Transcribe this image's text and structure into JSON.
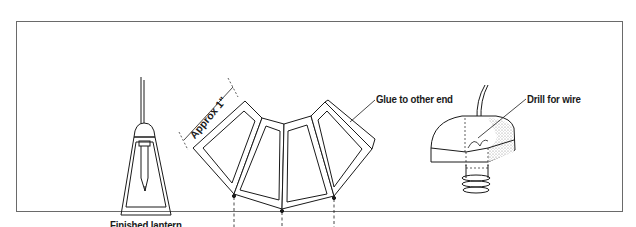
{
  "diagram": {
    "labels": {
      "finished_lantern": "Finished lantern",
      "approx": "Approx 1\"",
      "glue": "Glue to other end",
      "bend": "Bend",
      "drill": "Drill for wire"
    },
    "colors": {
      "line": "#1a1a1a",
      "frame": "#6a6a6a",
      "stipple": "#bdbdbd"
    }
  }
}
